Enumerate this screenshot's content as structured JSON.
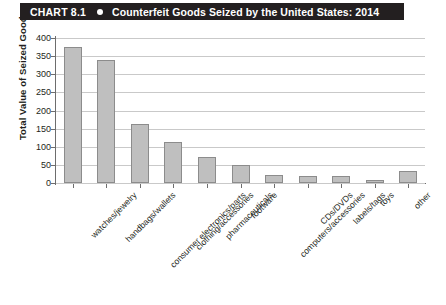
{
  "header": {
    "chart_number": "CHART 8.1",
    "bullet_icon": "bullet-dot-icon",
    "title": "Counterfeit Goods Seized by the United States: 2014",
    "background_color": "#231f20",
    "text_color": "#ffffff"
  },
  "chart_data": {
    "type": "bar",
    "title": "Counterfeit Goods Seized by the United States: 2014",
    "xlabel": "",
    "ylabel": "Total Value of Seized Goods",
    "ylim": [
      0,
      400
    ],
    "yticks": [
      0,
      50,
      100,
      150,
      200,
      250,
      300,
      350,
      400
    ],
    "ytick_labels": [
      "0",
      "50",
      "100",
      "150",
      "200",
      "250",
      "300",
      "350",
      "400"
    ],
    "grid": true,
    "legend": "none",
    "bar_color": "#bfbfbf",
    "bar_border_color": "#8c8c8c",
    "categories": [
      "watches/jewelry",
      "handbags/wallets",
      "consumer electronics/parts",
      "clothing/accessories",
      "pharmaceuticals",
      "footware",
      "computers/accessories",
      "CDs/DVDs",
      "labels/tags",
      "toys",
      "other"
    ],
    "values": [
      375,
      339,
      162,
      113,
      72,
      49,
      22,
      18,
      18,
      8,
      33
    ]
  }
}
